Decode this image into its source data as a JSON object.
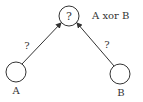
{
  "diagram": {
    "type": "perceptron-network",
    "nodes": {
      "output": {
        "symbol": "?",
        "label": "A xor B",
        "cx": 69,
        "cy": 16,
        "r": 10
      },
      "input_a": {
        "symbol": "",
        "label": "A",
        "cx": 16,
        "cy": 72,
        "r": 10
      },
      "input_b": {
        "symbol": "",
        "label": "B",
        "cx": 120,
        "cy": 74,
        "r": 10
      }
    },
    "edges": [
      {
        "from": "input_a",
        "to": "output",
        "weight_label": "?"
      },
      {
        "from": "input_b",
        "to": "output",
        "weight_label": "?"
      }
    ],
    "colors": {
      "stroke": "#333333",
      "background": "#ffffff"
    }
  }
}
